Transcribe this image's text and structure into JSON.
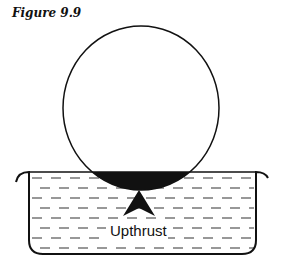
{
  "figure": {
    "title": "Figure 9.9",
    "arrow_label": "Upthrust"
  },
  "colors": {
    "ink": "#111111",
    "background": "#ffffff"
  }
}
